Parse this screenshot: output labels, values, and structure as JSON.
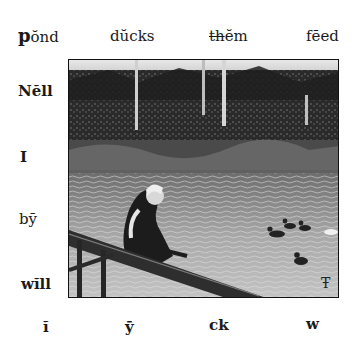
{
  "page": {
    "cutoff_header": "— — — —",
    "top_words": [
      {
        "text": "pŏnd",
        "first": "p",
        "rest": "ŏnd"
      },
      {
        "text": "dŭcks"
      },
      {
        "text": "thĕm",
        "digraph": "th",
        "rest": "ĕm"
      },
      {
        "text": "fēed"
      }
    ],
    "left_words": [
      "Nĕll",
      "I",
      "bȳ",
      "wĭll"
    ],
    "bottom_letters": [
      "ĭ",
      "ȳ",
      "ck",
      "w"
    ],
    "illustration": {
      "description": "Engraving of a girl leaning on a wooden rail by a pond with ducks, trees in background",
      "monogram": "Ŧ"
    }
  }
}
